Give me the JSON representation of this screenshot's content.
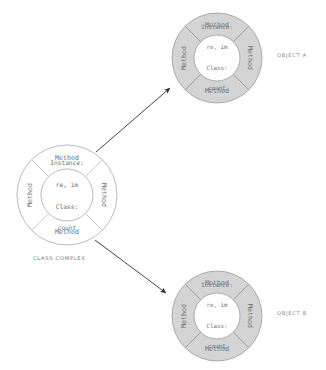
{
  "diagram": {
    "title_visible": false,
    "colors": {
      "ring_fill_object": "#d4d4d4",
      "ring_fill_class": "#ffffff",
      "core_fill": "#ffffff",
      "stroke": "#9a9a9a",
      "stroke_light": "#b4b4b4",
      "text": "#6f6f6f",
      "caption": "#8d8d8d",
      "arrow": "#3a3a3a",
      "background": "#ffffff"
    },
    "nodes": [
      {
        "id": "class-complex",
        "caption": "class Complex",
        "caption_style": "small-caps",
        "filled": false,
        "cx": 67,
        "cy": 195,
        "r_outer": 50,
        "r_inner": 26,
        "segments": [
          {
            "position": "top",
            "label": "Method"
          },
          {
            "position": "right",
            "label": "Method"
          },
          {
            "position": "bottom",
            "label": "Method"
          },
          {
            "position": "left",
            "label": "Method"
          }
        ],
        "core": {
          "lines": [
            "Instance:",
            "re, im",
            "Class:",
            "count"
          ],
          "instance_label": "Instance:",
          "instance_vars": "re, im",
          "class_label": "Class:",
          "class_vars": "count"
        }
      },
      {
        "id": "object-a",
        "caption": "object a",
        "caption_style": "small-caps",
        "filled": true,
        "cx": 217,
        "cy": 58,
        "r_outer": 45,
        "r_inner": 23,
        "segments": [
          {
            "position": "top",
            "label": "Method"
          },
          {
            "position": "right",
            "label": "Method"
          },
          {
            "position": "bottom",
            "label": "Method"
          },
          {
            "position": "left",
            "label": "Method"
          }
        ],
        "core": {
          "lines": [
            "Instance:",
            "re, im",
            "Class:",
            "count"
          ],
          "instance_label": "Instance:",
          "instance_vars": "re, im",
          "class_label": "Class:",
          "class_vars": "count"
        }
      },
      {
        "id": "object-b",
        "caption": "object b",
        "caption_style": "small-caps",
        "filled": true,
        "cx": 217,
        "cy": 316,
        "r_outer": 45,
        "r_inner": 23,
        "segments": [
          {
            "position": "top",
            "label": "Method"
          },
          {
            "position": "right",
            "label": "Method"
          },
          {
            "position": "bottom",
            "label": "Method"
          },
          {
            "position": "left",
            "label": "Method"
          }
        ],
        "core": {
          "lines": [
            "Instance:",
            "re, im",
            "Class:",
            "count"
          ],
          "instance_label": "Instance:",
          "instance_vars": "re, im",
          "class_label": "Class:",
          "class_vars": "count"
        }
      }
    ],
    "arrows": [
      {
        "id": "class-to-object-a",
        "from": "class-complex",
        "to": "object-a",
        "x1": 96,
        "y1": 152,
        "x2": 172,
        "y2": 87
      },
      {
        "id": "class-to-object-b",
        "from": "class-complex",
        "to": "object-b",
        "x1": 95,
        "y1": 240,
        "x2": 168,
        "y2": 295
      }
    ]
  }
}
